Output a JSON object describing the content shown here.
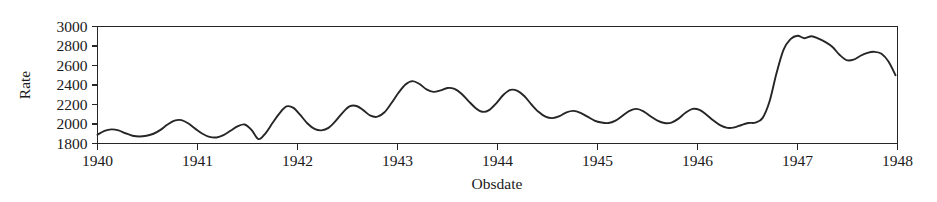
{
  "chart_data": {
    "type": "line",
    "title": "",
    "xlabel": "Obsdate",
    "ylabel": "Rate",
    "xlim": [
      1940,
      1948
    ],
    "ylim": [
      1800,
      3000
    ],
    "grid": false,
    "legend": null,
    "xticks": [
      1940,
      1941,
      1942,
      1943,
      1944,
      1945,
      1946,
      1947,
      1948
    ],
    "xtick_labels": [
      "1940",
      "1941",
      "1942",
      "1943",
      "1944",
      "1945",
      "1946",
      "1947",
      "1948"
    ],
    "yticks": [
      1800,
      2000,
      2200,
      2400,
      2600,
      2800,
      3000
    ],
    "ytick_labels": [
      "1800",
      "2000",
      "2200",
      "2400",
      "2600",
      "2800",
      "3000"
    ],
    "line_color": "#262626",
    "background_color": "#ffffff",
    "series": [
      {
        "name": "Rate",
        "x": [
          1940.0,
          1940.07,
          1940.14,
          1940.21,
          1940.28,
          1940.35,
          1940.42,
          1940.49,
          1940.56,
          1940.63,
          1940.7,
          1940.77,
          1940.84,
          1940.91,
          1940.98,
          1941.05,
          1941.12,
          1941.19,
          1941.26,
          1941.33,
          1941.4,
          1941.47,
          1941.54,
          1941.61,
          1941.68,
          1941.75,
          1941.82,
          1941.89,
          1941.96,
          1942.03,
          1942.1,
          1942.17,
          1942.24,
          1942.31,
          1942.38,
          1942.45,
          1942.52,
          1942.59,
          1942.66,
          1942.73,
          1942.8,
          1942.87,
          1942.94,
          1943.01,
          1943.08,
          1943.15,
          1943.22,
          1943.29,
          1943.36,
          1943.43,
          1943.5,
          1943.57,
          1943.64,
          1943.71,
          1943.78,
          1943.85,
          1943.92,
          1943.99,
          1944.06,
          1944.13,
          1944.2,
          1944.27,
          1944.34,
          1944.41,
          1944.48,
          1944.55,
          1944.62,
          1944.69,
          1944.76,
          1944.83,
          1944.9,
          1944.97,
          1945.04,
          1945.11,
          1945.18,
          1945.25,
          1945.32,
          1945.39,
          1945.46,
          1945.53,
          1945.6,
          1945.67,
          1945.74,
          1945.81,
          1945.88,
          1945.95,
          1946.02,
          1946.09,
          1946.16,
          1946.23,
          1946.3,
          1946.37,
          1946.44,
          1946.51,
          1946.58,
          1946.65,
          1946.72,
          1946.79,
          1946.86,
          1946.93,
          1947.0,
          1947.07,
          1947.14,
          1947.21,
          1947.28,
          1947.35,
          1947.42,
          1947.49,
          1947.56,
          1947.63,
          1947.7,
          1947.77,
          1947.84,
          1947.91,
          1947.98
        ],
        "values": [
          1890,
          1930,
          1945,
          1935,
          1905,
          1880,
          1872,
          1880,
          1900,
          1940,
          1995,
          2035,
          2040,
          2005,
          1950,
          1900,
          1868,
          1862,
          1885,
          1930,
          1975,
          1995,
          1940,
          1845,
          1905,
          2010,
          2110,
          2180,
          2165,
          2090,
          2005,
          1950,
          1935,
          1960,
          2030,
          2115,
          2180,
          2185,
          2140,
          2085,
          2075,
          2120,
          2215,
          2320,
          2405,
          2440,
          2410,
          2355,
          2330,
          2345,
          2370,
          2360,
          2310,
          2235,
          2165,
          2125,
          2145,
          2215,
          2300,
          2350,
          2340,
          2285,
          2200,
          2125,
          2075,
          2060,
          2080,
          2120,
          2135,
          2115,
          2075,
          2035,
          2015,
          2010,
          2035,
          2085,
          2135,
          2155,
          2130,
          2080,
          2035,
          2010,
          2015,
          2055,
          2115,
          2155,
          2145,
          2095,
          2035,
          1985,
          1960,
          1965,
          1990,
          2010,
          2015,
          2060,
          2230,
          2520,
          2760,
          2870,
          2905,
          2880,
          2900,
          2875,
          2840,
          2790,
          2710,
          2655,
          2660,
          2700,
          2730,
          2740,
          2720,
          2640,
          2500
        ]
      }
    ]
  }
}
